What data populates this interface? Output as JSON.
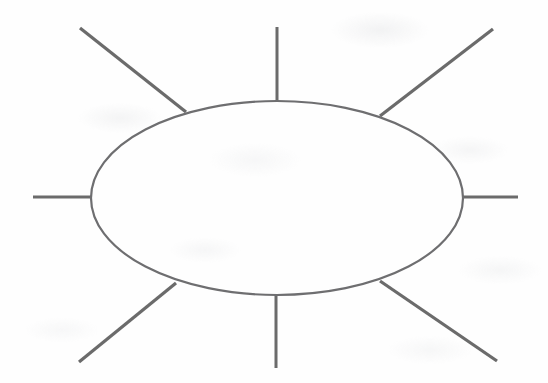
{
  "document": {
    "title": "Spider Diagram Template",
    "kind": "hand-drawn-worksheet",
    "width": 548,
    "height": 383,
    "background_color": "#fefefe"
  },
  "style": {
    "line_color": "#6b6b6b",
    "ellipse_stroke_color": "#6e6e70",
    "ellipse_stroke_width": 2.2,
    "spoke_stroke_width": 3,
    "ellipse_fill": "none"
  },
  "shapes": {
    "central_ellipse": {
      "name": "central-ellipse",
      "cx": 277,
      "cy": 198,
      "rx": 186,
      "ry": 97,
      "label": ""
    },
    "spokes": [
      {
        "name": "spoke-top",
        "direction": "top",
        "x1": 277,
        "y1": 27,
        "x2": 277,
        "y2": 101,
        "label": ""
      },
      {
        "name": "spoke-top-left",
        "direction": "top-left",
        "x1": 80,
        "y1": 28,
        "x2": 186,
        "y2": 112,
        "label": ""
      },
      {
        "name": "spoke-top-right",
        "direction": "top-right",
        "x1": 493,
        "y1": 29,
        "x2": 380,
        "y2": 116,
        "label": ""
      },
      {
        "name": "spoke-left",
        "direction": "left",
        "x1": 33,
        "y1": 197,
        "x2": 92,
        "y2": 197,
        "label": ""
      },
      {
        "name": "spoke-right",
        "direction": "right",
        "x1": 463,
        "y1": 197,
        "x2": 518,
        "y2": 197,
        "label": ""
      },
      {
        "name": "spoke-bottom-left",
        "direction": "bottom-left",
        "x1": 176,
        "y1": 283,
        "x2": 79,
        "y2": 362,
        "label": ""
      },
      {
        "name": "spoke-bottom",
        "direction": "bottom",
        "x1": 276,
        "y1": 295,
        "x2": 276,
        "y2": 368,
        "label": ""
      },
      {
        "name": "spoke-bottom-right",
        "direction": "bottom-right",
        "x1": 380,
        "y1": 281,
        "x2": 497,
        "y2": 361,
        "label": ""
      }
    ]
  }
}
